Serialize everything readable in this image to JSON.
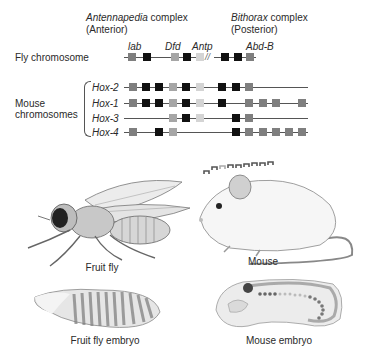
{
  "header": {
    "antennapedia": {
      "name": "Antennapedia",
      "suffix": " complex",
      "sub": "(Anterior)"
    },
    "bithorax": {
      "name": "Bithorax",
      "suffix": " complex",
      "sub": "(Posterior)"
    }
  },
  "fly": {
    "label": "Fly chromosome",
    "genes": [
      "lab",
      "Dfd",
      "Antp",
      "Abd-B"
    ],
    "break_marker": "//",
    "boxes": [
      {
        "x": 128,
        "shade": "mid"
      },
      {
        "x": 143,
        "shade": "dark"
      },
      {
        "x": 171,
        "shade": "light"
      },
      {
        "x": 183,
        "shade": "dark"
      },
      {
        "x": 196,
        "shade": "pale"
      },
      {
        "x": 221,
        "shade": "dark"
      },
      {
        "x": 234,
        "shade": "dark"
      },
      {
        "x": 246,
        "shade": "mid"
      }
    ]
  },
  "mouse": {
    "label_line1": "Mouse",
    "label_line2": "chromosomes",
    "rows": [
      {
        "name": "Hox-2",
        "y": 87,
        "line": [
          124,
          308
        ],
        "boxes": [
          {
            "x": 129,
            "s": "mid"
          },
          {
            "x": 142,
            "s": "dark"
          },
          {
            "x": 155,
            "s": "dark"
          },
          {
            "x": 169,
            "s": "light"
          },
          {
            "x": 182,
            "s": "dark"
          },
          {
            "x": 196,
            "s": "pale"
          },
          {
            "x": 218,
            "s": "dark"
          },
          {
            "x": 232,
            "s": "dark"
          },
          {
            "x": 245,
            "s": "mid"
          }
        ]
      },
      {
        "name": "Hox-1",
        "y": 103,
        "line": [
          124,
          308
        ],
        "boxes": [
          {
            "x": 129,
            "s": "mid"
          },
          {
            "x": 142,
            "s": "dark"
          },
          {
            "x": 155,
            "s": "dark"
          },
          {
            "x": 169,
            "s": "light"
          },
          {
            "x": 182,
            "s": "dark"
          },
          {
            "x": 196,
            "s": "pale"
          },
          {
            "x": 218,
            "s": "dark"
          },
          {
            "x": 245,
            "s": "mid"
          },
          {
            "x": 259,
            "s": "mid"
          },
          {
            "x": 272,
            "s": "mid"
          },
          {
            "x": 298,
            "s": "mid"
          }
        ]
      },
      {
        "name": "Hox-3",
        "y": 118,
        "line": [
          124,
          308
        ],
        "boxes": [
          {
            "x": 169,
            "s": "light"
          },
          {
            "x": 182,
            "s": "dark"
          },
          {
            "x": 196,
            "s": "pale"
          },
          {
            "x": 232,
            "s": "dark"
          },
          {
            "x": 245,
            "s": "mid"
          }
        ]
      },
      {
        "name": "Hox-4",
        "y": 132,
        "line": [
          124,
          308
        ],
        "boxes": [
          {
            "x": 129,
            "s": "mid"
          },
          {
            "x": 155,
            "s": "dark"
          },
          {
            "x": 169,
            "s": "light"
          },
          {
            "x": 232,
            "s": "dark"
          },
          {
            "x": 245,
            "s": "mid"
          },
          {
            "x": 259,
            "s": "mid"
          },
          {
            "x": 272,
            "s": "mid"
          },
          {
            "x": 285,
            "s": "mid"
          },
          {
            "x": 298,
            "s": "mid"
          }
        ]
      }
    ]
  },
  "illustrations": {
    "fruit_fly": "Fruit fly",
    "mouse": "Mouse",
    "fruit_fly_embryo": "Fruit fly embryo",
    "mouse_embryo": "Mouse embryo"
  },
  "colors": {
    "dark": "#111111",
    "mid": "#7f7f7f",
    "light": "#a6a6a6",
    "pale": "#d4d4d4",
    "line": "#555555"
  }
}
